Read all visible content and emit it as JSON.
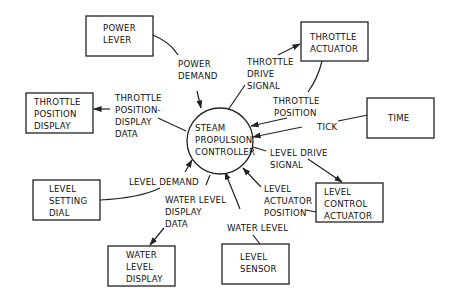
{
  "diagram": {
    "type": "context data flow diagram",
    "process": {
      "id": "steam-propulsion-controller",
      "lines": [
        "STEAM",
        "PROPULSION",
        "CONTROLLER"
      ]
    },
    "entities": [
      {
        "id": "power-lever",
        "lines": [
          "POWER",
          "LEVER"
        ]
      },
      {
        "id": "throttle-actuator",
        "lines": [
          "THROTTLE",
          "ACTUATOR"
        ]
      },
      {
        "id": "throttle-position-display",
        "lines": [
          "THROTTLE",
          "POSITION",
          "DISPLAY"
        ]
      },
      {
        "id": "time",
        "lines": [
          "TIME"
        ]
      },
      {
        "id": "level-setting-dial",
        "lines": [
          "LEVEL",
          "SETTING",
          "DIAL"
        ]
      },
      {
        "id": "level-control-actuator",
        "lines": [
          "LEVEL",
          "CONTROL",
          "ACTUATOR"
        ]
      },
      {
        "id": "water-level-display",
        "lines": [
          "WATER",
          "LEVEL",
          "DISPLAY"
        ]
      },
      {
        "id": "level-sensor",
        "lines": [
          "LEVEL",
          "SENSOR"
        ]
      }
    ],
    "flows": [
      {
        "id": "power-demand",
        "from": "power-lever",
        "to": "steam-propulsion-controller",
        "lines": [
          "POWER",
          "DEMAND"
        ]
      },
      {
        "id": "throttle-drive-signal",
        "from": "steam-propulsion-controller",
        "to": "throttle-actuator",
        "lines": [
          "THROTTLE",
          "DRIVE",
          "SIGNAL"
        ]
      },
      {
        "id": "throttle-position",
        "from": "throttle-actuator",
        "to": "steam-propulsion-controller",
        "lines": [
          "THROTTLE",
          "POSITION"
        ]
      },
      {
        "id": "throttle-position-display-data",
        "from": "steam-propulsion-controller",
        "to": "throttle-position-display",
        "lines": [
          "THROTTLE",
          "POSITION-",
          "DISPLAY",
          "DATA"
        ]
      },
      {
        "id": "tick",
        "from": "time",
        "to": "steam-propulsion-controller",
        "lines": [
          "TICK"
        ]
      },
      {
        "id": "level-drive-signal",
        "from": "steam-propulsion-controller",
        "to": "level-control-actuator",
        "lines": [
          "LEVEL DRIVE",
          "SIGNAL"
        ]
      },
      {
        "id": "level-demand",
        "from": "level-setting-dial",
        "to": "steam-propulsion-controller",
        "lines": [
          "LEVEL DEMAND"
        ]
      },
      {
        "id": "level-actuator-position",
        "from": "level-control-actuator",
        "to": "steam-propulsion-controller",
        "lines": [
          "LEVEL",
          "ACTUATOR",
          "POSITION"
        ]
      },
      {
        "id": "water-level-display-data",
        "from": "steam-propulsion-controller",
        "to": "water-level-display",
        "lines": [
          "WATER LEVEL",
          "DISPLAY",
          "DATA"
        ]
      },
      {
        "id": "water-level",
        "from": "level-sensor",
        "to": "steam-propulsion-controller",
        "lines": [
          "WATER LEVEL"
        ]
      }
    ]
  }
}
